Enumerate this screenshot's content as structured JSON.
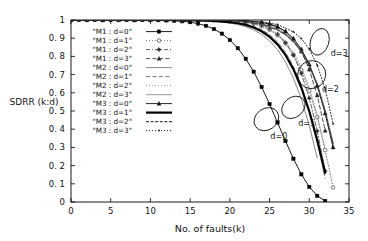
{
  "chart_data": {
    "type": "line",
    "title": "",
    "xlabel": "No. of faults(k)",
    "ylabel": "SDRR (k:d)",
    "xlim": [
      0,
      35
    ],
    "ylim": [
      0,
      1
    ],
    "xticks": [
      0,
      5,
      10,
      15,
      20,
      25,
      30,
      35
    ],
    "xtick_labels": [
      "0",
      "5",
      "10",
      "15",
      "20",
      "25",
      "30",
      "35"
    ],
    "yticks": [
      0,
      0.1,
      0.2,
      0.3,
      0.4,
      0.5,
      0.6,
      0.7,
      0.8,
      0.9,
      1
    ],
    "ytick_labels": [
      "0",
      "0. 1",
      "0. 2",
      "0. 3",
      "0. 4",
      "0. 5",
      "0. 6",
      "0. 7",
      "0. 8",
      "0. 9",
      "1"
    ],
    "grid": false,
    "legend_position": "upper-left-inside",
    "series": [
      {
        "name": "\"M1 : d=0\"",
        "model": "M1",
        "d": 0,
        "style": "line-marker",
        "marker": "filled-square",
        "dash": "none",
        "color": "#000000",
        "width": 0.9,
        "x": [
          0,
          1,
          2,
          3,
          4,
          5,
          6,
          7,
          8,
          9,
          10,
          11,
          12,
          13,
          14,
          15,
          16,
          17,
          18,
          19,
          20,
          21,
          22,
          23,
          24,
          25,
          26,
          27,
          28,
          29,
          30,
          31,
          32
        ],
        "y": [
          1,
          1,
          1,
          1,
          1,
          1,
          1,
          1,
          1,
          1,
          1,
          0.999,
          0.998,
          0.996,
          0.993,
          0.988,
          0.98,
          0.968,
          0.95,
          0.925,
          0.89,
          0.845,
          0.787,
          0.716,
          0.632,
          0.538,
          0.437,
          0.335,
          0.238,
          0.152,
          0.083,
          0.034,
          0.006
        ]
      },
      {
        "name": "\"M1 : d=1\"",
        "model": "M1",
        "d": 1,
        "style": "line-marker",
        "marker": "open-circle",
        "dash": "dotted",
        "color": "#555555",
        "width": 0.8,
        "x": [
          0,
          2,
          4,
          6,
          8,
          10,
          12,
          14,
          16,
          18,
          20,
          21,
          22,
          23,
          24,
          25,
          26,
          27,
          28,
          29,
          30,
          31,
          32,
          33
        ],
        "y": [
          1,
          1,
          1,
          1,
          1,
          1,
          1,
          1,
          0.999,
          0.998,
          0.995,
          0.992,
          0.987,
          0.979,
          0.966,
          0.946,
          0.916,
          0.872,
          0.81,
          0.725,
          0.612,
          0.466,
          0.285,
          0.08
        ]
      },
      {
        "name": "\"M1 : d=2\"",
        "model": "M1",
        "d": 2,
        "style": "line-marker",
        "marker": "filled-diamond",
        "dash": "dashdot",
        "color": "#333333",
        "width": 0.8,
        "x": [
          0,
          2,
          4,
          6,
          8,
          10,
          12,
          14,
          16,
          18,
          20,
          22,
          23,
          24,
          25,
          26,
          27,
          28,
          29,
          30,
          31,
          32
        ],
        "y": [
          1,
          1,
          1,
          1,
          1,
          1,
          1,
          1,
          1,
          0.999,
          0.997,
          0.99,
          0.983,
          0.971,
          0.952,
          0.922,
          0.876,
          0.807,
          0.707,
          0.57,
          0.39,
          0.17
        ]
      },
      {
        "name": "\"M1 : d=3\"",
        "model": "M1",
        "d": 3,
        "style": "line-marker",
        "marker": "filled-triangle",
        "dash": "dashed",
        "color": "#222222",
        "width": 0.8,
        "x": [
          0,
          2,
          4,
          6,
          8,
          10,
          12,
          14,
          16,
          18,
          20,
          22,
          24,
          25,
          26,
          27,
          28,
          29,
          30,
          31,
          32
        ],
        "y": [
          1,
          1,
          1,
          1,
          1,
          1,
          1,
          1,
          1,
          1,
          0.999,
          0.996,
          0.987,
          0.978,
          0.962,
          0.936,
          0.893,
          0.827,
          0.728,
          0.586,
          0.392
        ]
      },
      {
        "name": "\"M2 : d=0\"",
        "model": "M2",
        "d": 0,
        "style": "line",
        "marker": "none",
        "dash": "none",
        "color": "#888888",
        "width": 1.0,
        "x": [
          0,
          4,
          8,
          12,
          16,
          18,
          20,
          21,
          22,
          23,
          24,
          25,
          26,
          27,
          28,
          29,
          30,
          31
        ],
        "y": [
          1,
          1,
          1,
          0.999,
          0.996,
          0.992,
          0.983,
          0.975,
          0.963,
          0.946,
          0.921,
          0.886,
          0.837,
          0.77,
          0.681,
          0.566,
          0.42,
          0.243
        ]
      },
      {
        "name": "\"M2 : d=1\"",
        "model": "M2",
        "d": 1,
        "style": "line",
        "marker": "none",
        "dash": "dashed",
        "color": "#777777",
        "width": 1.0,
        "x": [
          0,
          4,
          8,
          12,
          16,
          18,
          20,
          22,
          23,
          24,
          25,
          26,
          27,
          28,
          29,
          30,
          31,
          32
        ],
        "y": [
          1,
          1,
          1,
          1,
          0.998,
          0.996,
          0.991,
          0.977,
          0.965,
          0.947,
          0.92,
          0.88,
          0.823,
          0.744,
          0.638,
          0.5,
          0.33,
          0.13
        ]
      },
      {
        "name": "\"M2 : d=2\"",
        "model": "M2",
        "d": 2,
        "style": "line",
        "marker": "none",
        "dash": "dotted",
        "color": "#999999",
        "width": 1.0,
        "x": [
          0,
          4,
          8,
          12,
          16,
          20,
          22,
          24,
          25,
          26,
          27,
          28,
          29,
          30,
          31,
          32
        ],
        "y": [
          1,
          1,
          1,
          1,
          0.999,
          0.995,
          0.987,
          0.968,
          0.95,
          0.923,
          0.883,
          0.825,
          0.743,
          0.63,
          0.48,
          0.29
        ]
      },
      {
        "name": "\"M2 : d=3\"",
        "model": "M2",
        "d": 3,
        "style": "line",
        "marker": "none",
        "dash": "none",
        "color": "#aaaaaa",
        "width": 1.2,
        "x": [
          0,
          4,
          8,
          12,
          16,
          20,
          22,
          24,
          26,
          27,
          28,
          29,
          30,
          31,
          32,
          33
        ],
        "y": [
          1,
          1,
          1,
          1,
          1,
          0.998,
          0.993,
          0.982,
          0.955,
          0.93,
          0.892,
          0.836,
          0.756,
          0.645,
          0.495,
          0.305
        ]
      },
      {
        "name": "\"M3 : d=0\"",
        "model": "M3",
        "d": 0,
        "style": "line-marker",
        "marker": "filled-triangle",
        "dash": "none",
        "color": "#111111",
        "width": 0.9,
        "x": [
          0,
          4,
          8,
          12,
          16,
          20,
          22,
          24,
          25,
          26,
          27,
          28,
          29,
          30,
          31,
          32,
          33
        ],
        "y": [
          1,
          1,
          1,
          1,
          1,
          0.999,
          0.996,
          0.987,
          0.978,
          0.963,
          0.938,
          0.899,
          0.84,
          0.756,
          0.64,
          0.487,
          0.3
        ]
      },
      {
        "name": "\"M3 : d=1\"",
        "model": "M3",
        "d": 1,
        "style": "line",
        "marker": "none",
        "dash": "none",
        "color": "#000000",
        "width": 2.2,
        "x": [
          0,
          4,
          8,
          12,
          16,
          18,
          20,
          21,
          22,
          23,
          24,
          25,
          26,
          27,
          28,
          29,
          30,
          31,
          32
        ],
        "y": [
          1,
          1,
          1,
          1,
          0.998,
          0.995,
          0.988,
          0.982,
          0.973,
          0.959,
          0.938,
          0.908,
          0.866,
          0.808,
          0.73,
          0.628,
          0.498,
          0.34,
          0.16
        ]
      },
      {
        "name": "\"M3 : d=2\"",
        "model": "M3",
        "d": 2,
        "style": "line",
        "marker": "none",
        "dash": "dashed-dense",
        "color": "#444444",
        "width": 1.4,
        "x": [
          0,
          4,
          8,
          12,
          16,
          20,
          22,
          24,
          26,
          27,
          28,
          29,
          30,
          31,
          32,
          33
        ],
        "y": [
          1,
          1,
          1,
          1,
          1,
          0.997,
          0.991,
          0.977,
          0.946,
          0.92,
          0.882,
          0.828,
          0.75,
          0.645,
          0.5,
          0.32
        ]
      },
      {
        "name": "\"M3 : d=3\"",
        "model": "M3",
        "d": 3,
        "style": "line-marker",
        "marker": "small-dot",
        "dash": "dotted",
        "color": "#222222",
        "width": 1.0,
        "x": [
          0,
          4,
          8,
          12,
          16,
          20,
          24,
          26,
          28,
          29,
          30,
          31,
          32,
          33
        ],
        "y": [
          1,
          1,
          1,
          1,
          1,
          0.999,
          0.99,
          0.975,
          0.935,
          0.898,
          0.84,
          0.752,
          0.62,
          0.43
        ]
      }
    ],
    "annotations": [
      {
        "label": "d=0",
        "ellipse_x": 24.6,
        "ellipse_y": 0.455,
        "ellipse_rx": 1.35,
        "ellipse_ry": 0.072,
        "ellipse_rot": -35,
        "label_x": 25.1,
        "label_y": 0.345
      },
      {
        "label": "d=1",
        "ellipse_x": 28.0,
        "ellipse_y": 0.52,
        "ellipse_rx": 1.25,
        "ellipse_ry": 0.07,
        "ellipse_rot": -40,
        "label_x": 28.6,
        "label_y": 0.42
      },
      {
        "label": "d=2",
        "ellipse_x": 30.3,
        "ellipse_y": 0.7,
        "ellipse_rx": 1.75,
        "ellipse_ry": 0.078,
        "ellipse_rot": -42,
        "label_x": 31.6,
        "label_y": 0.605
      },
      {
        "label": "d=3",
        "ellipse_x": 31.3,
        "ellipse_y": 0.88,
        "ellipse_rx": 1.15,
        "ellipse_ry": 0.075,
        "ellipse_rot": -72,
        "label_x": 32.7,
        "label_y": 0.8
      }
    ]
  }
}
